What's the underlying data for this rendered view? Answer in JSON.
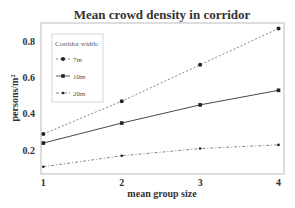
{
  "chart_data": {
    "type": "line",
    "title": "Mean crowd density in corridor",
    "xlabel": "mean group size",
    "ylabel": "persons/m²",
    "x": [
      1,
      2,
      3,
      4
    ],
    "xticks": [
      "1",
      "2",
      "3",
      "4"
    ],
    "yticks": [
      "0.2",
      "0.4",
      "0.6",
      "0.8"
    ],
    "xlim": [
      0.97,
      4.07
    ],
    "ylim": [
      0.07,
      0.9
    ],
    "grid": false,
    "legend": {
      "title": "Corridor width:",
      "position": "top-left"
    },
    "series": [
      {
        "name": "7m",
        "style": "dashed",
        "marker": "circle",
        "values": [
          0.29,
          0.47,
          0.67,
          0.87
        ]
      },
      {
        "name": "10m",
        "style": "solid",
        "marker": "square",
        "values": [
          0.24,
          0.35,
          0.45,
          0.53
        ]
      },
      {
        "name": "20m",
        "style": "dashdot",
        "marker": "star",
        "values": [
          0.11,
          0.17,
          0.21,
          0.23
        ]
      }
    ]
  }
}
